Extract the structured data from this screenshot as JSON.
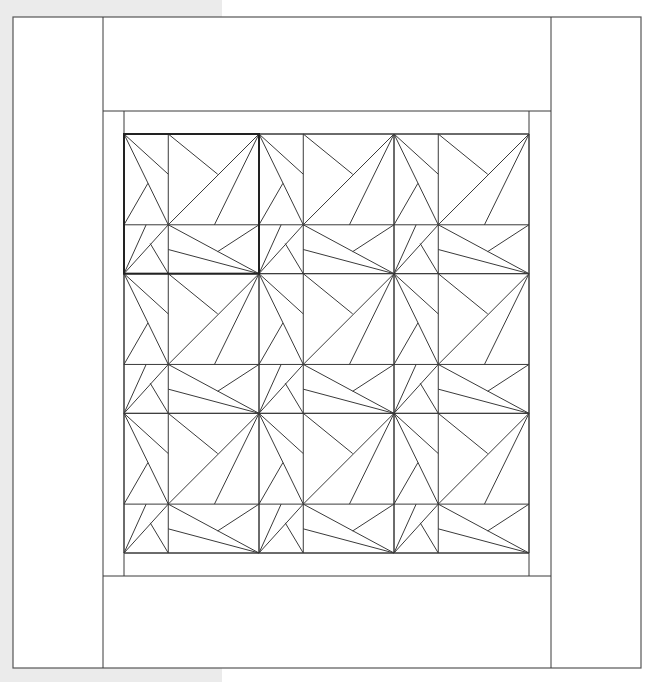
{
  "canvas": {
    "width": 653,
    "height": 682
  },
  "colors": {
    "page_background": "#ffffff",
    "left_strip_background": "#ebebeb",
    "line": "#3a3a3a",
    "highlight_line": "#222222",
    "fill": "#ffffff"
  },
  "layout": {
    "outer_frame": {
      "x1": 13,
      "y1": 17,
      "x2": 641,
      "y2": 668
    },
    "side_column_left_x": 103,
    "side_column_right_x": 551,
    "inner_border": {
      "x1": 103,
      "y1": 111,
      "x2": 551,
      "y2": 576
    },
    "inner_frame": {
      "x1": 124,
      "y1": 111,
      "x2": 529,
      "y2": 576
    },
    "quilt_area": {
      "x1": 124,
      "y1": 134,
      "x2": 529,
      "y2": 553
    },
    "grid": {
      "cols": 3,
      "rows": 3
    },
    "highlighted_block": {
      "col": 0,
      "row": 0
    }
  },
  "block_pattern": {
    "divider_u": 0.328,
    "divider_v": 0.65,
    "segments": [
      [
        0,
        0,
        0.328,
        0.288
      ],
      [
        0,
        0,
        0.328,
        0.65
      ],
      [
        0,
        0.65,
        0.177,
        0.353
      ],
      [
        0.328,
        0,
        0.694,
        0.288
      ],
      [
        1,
        0,
        0.328,
        0.65
      ],
      [
        1,
        0,
        0.67,
        0.65
      ],
      [
        0,
        1,
        0.164,
        0.65
      ],
      [
        0,
        1,
        0.328,
        0.65
      ],
      [
        0.194,
        0.784,
        0.328,
        1
      ],
      [
        0.328,
        0.65,
        1,
        1
      ],
      [
        0.328,
        0.827,
        1,
        1
      ],
      [
        1,
        0.65,
        0.694,
        0.842
      ]
    ]
  }
}
